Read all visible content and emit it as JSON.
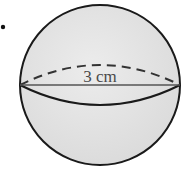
{
  "diagram": {
    "shape": "sphere",
    "dimension_label": "3 cm",
    "bullet": "•",
    "colors": {
      "fill": "#e3e3e3",
      "stroke": "#1a1a1a",
      "text": "#4a4a4a",
      "background": "#ffffff"
    }
  }
}
